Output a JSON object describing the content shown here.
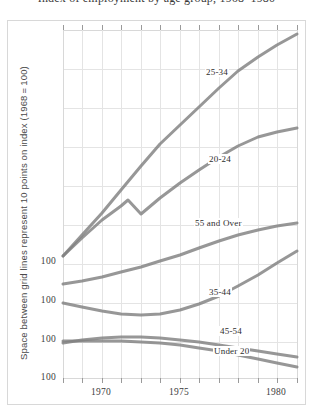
{
  "figure": {
    "title_clipped": "Index of employment by age group, 1968–1980",
    "y_axis_caption": "Space between grid lines represent 10 points on index (1968 = 100)",
    "y_tick_labels": [
      "100",
      "100",
      "100",
      "100"
    ],
    "x_tick_labels": [
      "1970",
      "1975",
      "1980"
    ],
    "line_color": "#808080",
    "grid_color": "#e4e4e4",
    "frame_color": "#d8d8d8",
    "text_color": "#3c3c3c"
  },
  "series_labels": [
    {
      "id": "s25_34",
      "text": "25-34",
      "x": 205,
      "y": 73
    },
    {
      "id": "s20_24",
      "text": "20-24",
      "x": 208,
      "y": 160
    },
    {
      "id": "s55over",
      "text": "55 and Over",
      "x": 194,
      "y": 224
    },
    {
      "id": "s35_44",
      "text": "35-44",
      "x": 208,
      "y": 293
    },
    {
      "id": "s45_54",
      "text": "45-54",
      "x": 219,
      "y": 332
    },
    {
      "id": "sunder20",
      "text": "Under 20",
      "x": 213,
      "y": 352
    }
  ],
  "chart_data": {
    "type": "line",
    "title": "Index of employment by age group, 1968–1980",
    "xlabel": "",
    "ylabel": "Space between grid lines represent 10 points on index (1968 = 100)",
    "xlim": [
      1968,
      1980
    ],
    "ylim_note": "Segmented axis: each band between grid lines = 10 index points; four separate 100-baselines are printed at left.",
    "xticks": [
      1970,
      1975,
      1980
    ],
    "xticklabels": [
      "1970",
      "1975",
      "1980"
    ],
    "yticklabels": [
      "100",
      "100",
      "100",
      "100"
    ],
    "grid": true,
    "legend": "inline-labels",
    "x": [
      1968,
      1969,
      1970,
      1971,
      1972,
      1973,
      1974,
      1975,
      1976,
      1977,
      1978,
      1979,
      1980
    ],
    "series": [
      {
        "name": "25-34",
        "color": "#808080",
        "values": [
          100,
          106,
          113,
          120,
          128,
          136,
          143,
          151,
          160,
          169,
          177,
          186,
          195
        ]
      },
      {
        "name": "20-24",
        "color": "#808080",
        "values": [
          100,
          109,
          118,
          124,
          121,
          127,
          133,
          139,
          145,
          151,
          157,
          161,
          164
        ]
      },
      {
        "name": "55 and Over",
        "color": "#808080",
        "values": [
          100,
          102,
          104,
          106,
          108,
          110,
          112,
          114,
          116,
          118,
          120,
          122,
          124
        ]
      },
      {
        "name": "35-44",
        "color": "#808080",
        "values": [
          100,
          99,
          98,
          97,
          97,
          98,
          100,
          103,
          107,
          112,
          117,
          122,
          127
        ]
      },
      {
        "name": "45-54",
        "color": "#808080",
        "values": [
          100,
          100,
          100,
          100,
          100,
          100,
          99,
          99,
          98,
          97,
          96,
          95,
          94
        ]
      },
      {
        "name": "Under 20",
        "color": "#808080",
        "values": [
          100,
          101,
          102,
          103,
          103,
          103,
          103,
          102,
          101,
          100,
          99,
          97,
          95
        ]
      }
    ]
  },
  "geometry": {
    "plot_left": 63,
    "plot_right": 297,
    "plot_top": 30,
    "plot_bottom": 378,
    "h_gridlines_y": [
      30,
      69,
      108,
      147,
      186,
      225,
      264,
      303,
      342,
      378
    ],
    "v_gridlines_x": [
      63,
      82,
      102,
      121,
      141,
      160,
      180,
      199,
      219,
      238,
      258,
      277,
      297
    ],
    "tick_len": 5,
    "curves": {
      "s25_34": "M63,256 L82,235 L102,213 L121,190 L141,166 L160,144 L180,125 L199,107 L219,88 L238,71 L258,57 L277,45 L297,34",
      "s20_24": "M63,256 L82,238 L102,220 L121,206 L128,200 L141,214 L160,198 L180,183 L199,170 L219,157 L238,146 L258,137 L277,132 L297,128",
      "s55over": "M63,284 L82,281 L102,277 L121,272 L141,267 L160,261 L180,255 L199,248 L219,241 L238,235 L258,230 L277,226 L297,223",
      "s35_44": "M63,303 L82,307 L102,311 L121,314 L141,315 L160,314 L180,310 L199,304 L219,296 L238,286 L258,275 L277,263 L297,251",
      "s45_54": "M63,341 L82,341 L102,341 L121,341 L141,342 L160,343 L180,345 L199,348 L219,351 L238,355 L258,359 L277,363 L297,367",
      "sunder20": "M63,343 L82,340 L102,338 L121,337 L141,337 L160,338 L180,340 L199,342 L219,345 L238,348 L258,351 L277,354 L297,357"
    },
    "ytick_positions": [
      {
        "y": 262
      },
      {
        "y": 301
      },
      {
        "y": 340
      },
      {
        "y": 378
      }
    ],
    "xtick_positions": [
      {
        "x": 101
      },
      {
        "x": 179
      },
      {
        "x": 276
      }
    ]
  }
}
